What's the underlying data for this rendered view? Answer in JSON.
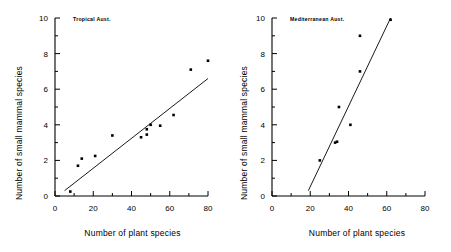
{
  "figure": {
    "panels": [
      {
        "tag": "Tropical Aust.",
        "xlabel": "Number of plant species",
        "ylabel": "Number of small mammal species"
      },
      {
        "tag": "Mediterranean Aust.",
        "xlabel": "Number of plant species",
        "ylabel": "Number of small mammal species"
      }
    ]
  },
  "chart_data": [
    {
      "type": "scatter",
      "title": "Tropical Aust.",
      "xlabel": "Number of plant species",
      "ylabel": "Number of small mammal species",
      "xlim": [
        0,
        80
      ],
      "ylim": [
        0,
        10
      ],
      "xticks": [
        0,
        10,
        20,
        30,
        40,
        50,
        60,
        70,
        80
      ],
      "xticklabels": [
        "0",
        "",
        "20",
        "",
        "40",
        "",
        "60",
        "",
        "80"
      ],
      "yticks": [
        0,
        1,
        2,
        3,
        4,
        5,
        6,
        7,
        8,
        9,
        10
      ],
      "yticklabels": [
        "0",
        "",
        "2",
        "",
        "4",
        "",
        "6",
        "",
        "8",
        "",
        "10"
      ],
      "grid": false,
      "legend": false,
      "marker": "filled-square",
      "points": [
        {
          "x": 8,
          "y": 0.25
        },
        {
          "x": 12,
          "y": 1.7
        },
        {
          "x": 14,
          "y": 2.1
        },
        {
          "x": 21,
          "y": 2.25
        },
        {
          "x": 30,
          "y": 3.4
        },
        {
          "x": 45,
          "y": 3.3
        },
        {
          "x": 48,
          "y": 3.45
        },
        {
          "x": 48,
          "y": 3.75
        },
        {
          "x": 50,
          "y": 4.0
        },
        {
          "x": 55,
          "y": 3.95
        },
        {
          "x": 62,
          "y": 4.55
        },
        {
          "x": 71,
          "y": 7.1
        },
        {
          "x": 80,
          "y": 7.6
        }
      ],
      "fit_line": {
        "x0": 5,
        "y0": 0.3,
        "x1": 80,
        "y1": 6.6
      }
    },
    {
      "type": "scatter",
      "title": "Mediterranean Aust.",
      "xlabel": "Number of plant species",
      "ylabel": "Number of small mammal species",
      "xlim": [
        0,
        80
      ],
      "ylim": [
        0,
        10
      ],
      "xticks": [
        0,
        10,
        20,
        30,
        40,
        50,
        60,
        70,
        80
      ],
      "xticklabels": [
        "0",
        "",
        "20",
        "",
        "40",
        "",
        "60",
        "",
        "80"
      ],
      "yticks": [
        0,
        1,
        2,
        3,
        4,
        5,
        6,
        7,
        8,
        9,
        10
      ],
      "yticklabels": [
        "0",
        "",
        "2",
        "",
        "4",
        "",
        "6",
        "",
        "8",
        "",
        "10"
      ],
      "grid": false,
      "legend": false,
      "marker": "filled-square",
      "points": [
        {
          "x": 25,
          "y": 2.0
        },
        {
          "x": 33,
          "y": 3.0
        },
        {
          "x": 34,
          "y": 3.05
        },
        {
          "x": 35,
          "y": 5.0
        },
        {
          "x": 41,
          "y": 4.0
        },
        {
          "x": 46,
          "y": 7.0
        },
        {
          "x": 46,
          "y": 9.0
        },
        {
          "x": 62,
          "y": 9.9
        }
      ],
      "fit_line": {
        "x0": 19,
        "y0": 0.3,
        "x1": 62,
        "y1": 10.0
      }
    }
  ]
}
